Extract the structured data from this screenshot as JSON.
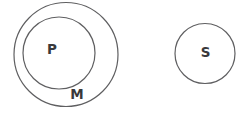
{
  "diagram": {
    "kind": "euler-diagram",
    "background_color": "#ffffff",
    "stroke_color": "#5f5f61",
    "label_color": "#39393b",
    "circles": [
      {
        "id": "outer-circle",
        "label": "M",
        "relation": "contains P"
      },
      {
        "id": "inner-circle",
        "label": "P",
        "relation": "inside M"
      },
      {
        "id": "separate-circle",
        "label": "S",
        "relation": "disjoint from M and P"
      }
    ]
  }
}
